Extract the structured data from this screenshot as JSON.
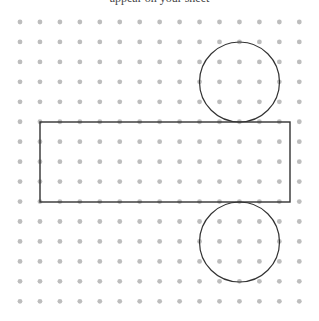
{
  "diagram": {
    "type": "cylinder-net-on-dot-grid",
    "header_fragment": "appear on your sheet",
    "grid": {
      "columns": 15,
      "rows": 15,
      "x0": 20,
      "y0": 22,
      "spacing": 19.95,
      "dot_radius": 2.4,
      "dot_color": "#bdbdbd"
    },
    "rectangle": {
      "x": 40,
      "y": 122,
      "width": 250,
      "height": 80,
      "stroke": "#333333",
      "stroke_width": 1.4
    },
    "circles": [
      {
        "name": "top-circle",
        "cx": 239.5,
        "cy": 82,
        "r": 40,
        "stroke": "#333333",
        "stroke_width": 1.2
      },
      {
        "name": "bottom-circle",
        "cx": 239.5,
        "cy": 242,
        "r": 40,
        "stroke": "#333333",
        "stroke_width": 1.2
      }
    ]
  }
}
